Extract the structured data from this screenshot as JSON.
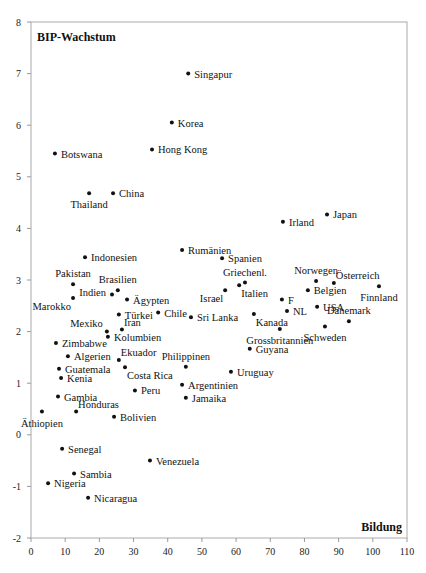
{
  "chart_data": {
    "type": "scatter",
    "title": "",
    "xlabel": "Bildung",
    "ylabel": "BIP-Wachstum",
    "xlim": [
      0,
      110
    ],
    "ylim": [
      -2,
      8
    ],
    "x_ticks": [
      0,
      10,
      20,
      30,
      40,
      50,
      60,
      70,
      80,
      90,
      100,
      110
    ],
    "y_ticks": [
      -2,
      -1,
      0,
      1,
      2,
      3,
      4,
      5,
      6,
      7,
      8
    ],
    "grid": false,
    "legend": null,
    "points": [
      {
        "label": "Singapur",
        "x": 46.0,
        "y": 7.0,
        "pos": "right"
      },
      {
        "label": "Korea",
        "x": 41.2,
        "y": 6.05,
        "pos": "right"
      },
      {
        "label": "Hong Kong",
        "x": 35.4,
        "y": 5.53,
        "pos": "right"
      },
      {
        "label": "Botswana",
        "x": 7.0,
        "y": 5.45,
        "pos": "right"
      },
      {
        "label": "Thailand",
        "x": 17.0,
        "y": 4.68,
        "pos": "below"
      },
      {
        "label": "China",
        "x": 24.0,
        "y": 4.68,
        "pos": "right"
      },
      {
        "label": "Japan",
        "x": 86.6,
        "y": 4.27,
        "pos": "right"
      },
      {
        "label": "Irland",
        "x": 73.7,
        "y": 4.13,
        "pos": "right"
      },
      {
        "label": "Rumänien",
        "x": 44.2,
        "y": 3.58,
        "pos": "right"
      },
      {
        "label": "Indonesien",
        "x": 15.8,
        "y": 3.44,
        "pos": "right"
      },
      {
        "label": "Spanien",
        "x": 55.9,
        "y": 3.42,
        "pos": "right"
      },
      {
        "label": "Norwegen",
        "x": 83.4,
        "y": 2.98,
        "pos": "above"
      },
      {
        "label": "Griechenl.",
        "x": 62.6,
        "y": 2.95,
        "pos": "above"
      },
      {
        "label": "Österreich",
        "x": 88.6,
        "y": 2.94,
        "pos": "aboveright"
      },
      {
        "label": "Pakistan",
        "x": 12.3,
        "y": 2.92,
        "pos": "above"
      },
      {
        "label": "Italien",
        "x": 60.9,
        "y": 2.9,
        "pos": "belowright"
      },
      {
        "label": "Finnland",
        "x": 101.8,
        "y": 2.88,
        "pos": "below"
      },
      {
        "label": "Brasilien",
        "x": 25.4,
        "y": 2.8,
        "pos": "above"
      },
      {
        "label": "Belgien",
        "x": 81.0,
        "y": 2.8,
        "pos": "right"
      },
      {
        "label": "Israel",
        "x": 56.8,
        "y": 2.8,
        "pos": "belowleft"
      },
      {
        "label": "Indien",
        "x": 23.7,
        "y": 2.72,
        "pos": "left"
      },
      {
        "label": "Marokko",
        "x": 12.3,
        "y": 2.65,
        "pos": "belowleft"
      },
      {
        "label": "F",
        "x": 73.4,
        "y": 2.62,
        "pos": "right"
      },
      {
        "label": "Ägypten",
        "x": 28.1,
        "y": 2.62,
        "pos": "right"
      },
      {
        "label": "USA",
        "x": 83.7,
        "y": 2.48,
        "pos": "right"
      },
      {
        "label": "NL",
        "x": 74.9,
        "y": 2.4,
        "pos": "right"
      },
      {
        "label": "Chile",
        "x": 37.2,
        "y": 2.37,
        "pos": "right"
      },
      {
        "label": "Kanada",
        "x": 65.2,
        "y": 2.34,
        "pos": "belowright"
      },
      {
        "label": "Türkei",
        "x": 25.7,
        "y": 2.33,
        "pos": "right"
      },
      {
        "label": "Sri Lanka",
        "x": 46.8,
        "y": 2.28,
        "pos": "right"
      },
      {
        "label": "Dänemark",
        "x": 93.0,
        "y": 2.2,
        "pos": "above"
      },
      {
        "label": "Schweden",
        "x": 86.0,
        "y": 2.1,
        "pos": "below"
      },
      {
        "label": "Grossbritannien",
        "x": 72.8,
        "y": 2.05,
        "pos": "below"
      },
      {
        "label": "Iran",
        "x": 26.6,
        "y": 2.04,
        "pos": "aboveright"
      },
      {
        "label": "Mexiko",
        "x": 22.2,
        "y": 2.0,
        "pos": "aboveleft"
      },
      {
        "label": "Kolumbien",
        "x": 22.5,
        "y": 1.9,
        "pos": "right"
      },
      {
        "label": "Zimbabwe",
        "x": 7.3,
        "y": 1.78,
        "pos": "right"
      },
      {
        "label": "Guyana",
        "x": 64.0,
        "y": 1.67,
        "pos": "right"
      },
      {
        "label": "Algerien",
        "x": 10.8,
        "y": 1.52,
        "pos": "right"
      },
      {
        "label": "Ekuador",
        "x": 25.7,
        "y": 1.45,
        "pos": "aboveright"
      },
      {
        "label": "Philippinen",
        "x": 45.3,
        "y": 1.32,
        "pos": "above"
      },
      {
        "label": "Costa Rica",
        "x": 27.5,
        "y": 1.31,
        "pos": "belowright"
      },
      {
        "label": "Guatemala",
        "x": 8.2,
        "y": 1.28,
        "pos": "right"
      },
      {
        "label": "Uruguay",
        "x": 58.5,
        "y": 1.22,
        "pos": "right"
      },
      {
        "label": "Kenia",
        "x": 8.8,
        "y": 1.1,
        "pos": "right"
      },
      {
        "label": "Argentinien",
        "x": 44.2,
        "y": 0.97,
        "pos": "right"
      },
      {
        "label": "Peru",
        "x": 30.4,
        "y": 0.86,
        "pos": "right"
      },
      {
        "label": "Gambia",
        "x": 7.9,
        "y": 0.74,
        "pos": "right"
      },
      {
        "label": "Jamaika",
        "x": 45.3,
        "y": 0.72,
        "pos": "right"
      },
      {
        "label": "Honduras",
        "x": 13.2,
        "y": 0.45,
        "pos": "aboveright"
      },
      {
        "label": "Äthiopien",
        "x": 3.2,
        "y": 0.45,
        "pos": "below"
      },
      {
        "label": "Bolivien",
        "x": 24.3,
        "y": 0.35,
        "pos": "right"
      },
      {
        "label": "Senegal",
        "x": 9.1,
        "y": -0.27,
        "pos": "right"
      },
      {
        "label": "Venezuela",
        "x": 34.8,
        "y": -0.5,
        "pos": "right"
      },
      {
        "label": "Sambia",
        "x": 12.6,
        "y": -0.75,
        "pos": "right"
      },
      {
        "label": "Nigeria",
        "x": 5.0,
        "y": -0.94,
        "pos": "right"
      },
      {
        "label": "Nicaragua",
        "x": 16.7,
        "y": -1.22,
        "pos": "right"
      }
    ]
  },
  "colors": {
    "axis": "#999999",
    "frame": "#aaaaaa",
    "point": "#111111",
    "text": "#111111",
    "background": "#ffffff"
  }
}
